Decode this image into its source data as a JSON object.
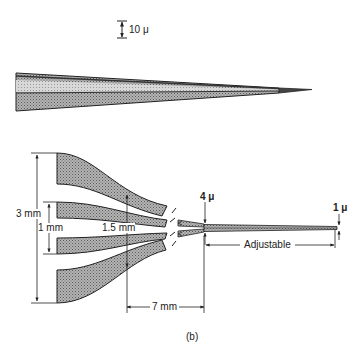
{
  "figure": {
    "caption": "(b)",
    "scale_bar": {
      "label": "10 μ"
    },
    "needle": {
      "description": "tapered fiber needle side view"
    },
    "fiber_bundle": {
      "labels": {
        "outer_height": "3 mm",
        "inner_height": "1 mm",
        "mid_gap": "1.5 mm",
        "taper_length": "7 mm",
        "taper_width": "4 μ",
        "tip_width": "1 μ",
        "tip_length": "Adjustable"
      }
    }
  },
  "colors": {
    "fill": "#9a9a9a",
    "fill_light": "#c8c8c8",
    "stroke": "#2a2a2a",
    "text": "#222222"
  }
}
